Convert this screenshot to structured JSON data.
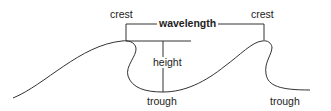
{
  "diagram": {
    "labels": {
      "crest_left": "crest",
      "crest_right": "crest",
      "wavelength": "wavelength",
      "height": "height",
      "trough_left": "trough",
      "trough_right": "trough"
    },
    "colors": {
      "line": "#333333",
      "text": "#222222",
      "background": "#ffffff"
    }
  }
}
